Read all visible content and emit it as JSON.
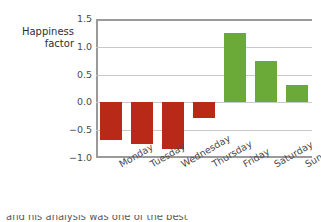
{
  "chart_data": {
    "type": "bar",
    "title": "",
    "xlabel": "",
    "ylabel": "Happiness\nfactor",
    "ylim": [
      -1.0,
      1.5
    ],
    "yticks": [
      "1.5",
      "1.0",
      "0.5",
      "0.0",
      "−0.5",
      "−1.0"
    ],
    "ytick_values": [
      1.5,
      1.0,
      0.5,
      0.0,
      -0.5,
      -1.0
    ],
    "grid": true,
    "legend": "none",
    "categories": [
      "Monday",
      "Tuesday",
      "Wednesday",
      "Thursday",
      "Friday",
      "Saturday",
      "Sunday"
    ],
    "values": [
      -0.68,
      -0.75,
      -0.83,
      -0.28,
      1.25,
      0.74,
      0.31
    ],
    "bar_colors": [
      "#b82a17",
      "#b82a17",
      "#b82a17",
      "#b82a17",
      "#6ba939",
      "#6ba939",
      "#6ba939"
    ],
    "colors": {
      "negative": "#b82a17",
      "positive": "#6ba939",
      "gridline": "#c9c9c9",
      "axis": "#9a9a9a",
      "text": "#4a4a4a"
    }
  },
  "caption": {
    "partial_text": "and his analysis was one of the best"
  }
}
